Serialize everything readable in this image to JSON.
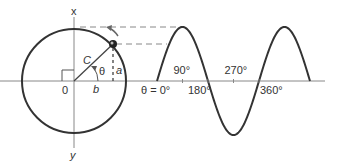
{
  "diagram": {
    "colors": {
      "stroke": "#333333",
      "axis": "#888888",
      "dashed": "#888888",
      "point": "#222222",
      "arrow": "#666666"
    },
    "axes": {
      "vertical_top_label": "x",
      "vertical_bottom_label": "y",
      "origin_label": "0"
    },
    "phasor": {
      "hypotenuse_label": "C",
      "angle_label": "θ",
      "opposite_label": "a",
      "adjacent_label": "b",
      "angle_degrees": 50
    },
    "wave": {
      "start_label": "θ = 0°",
      "ticks": [
        {
          "label": "90°",
          "degrees": 90,
          "position": "above"
        },
        {
          "label": "180°",
          "degrees": 180,
          "position": "below"
        },
        {
          "label": "270°",
          "degrees": 270,
          "position": "above"
        },
        {
          "label": "360°",
          "degrees": 360,
          "position": "below"
        }
      ],
      "cycles_shown": 1.5
    }
  }
}
